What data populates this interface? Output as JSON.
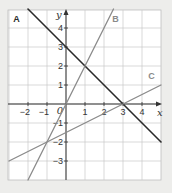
{
  "chart_data": {
    "type": "line",
    "title": "",
    "xlabel": "x",
    "ylabel": "y",
    "origin_label": "0",
    "xlim": [
      -3,
      5
    ],
    "ylim": [
      -4,
      5
    ],
    "grid": true,
    "x_ticks": [
      -2,
      -1,
      1,
      2,
      3,
      4
    ],
    "x_tick_labels": [
      "−2",
      "−1",
      "1",
      "2",
      "3",
      "4"
    ],
    "y_ticks": [
      4,
      3,
      2,
      1,
      -1,
      -2,
      -3
    ],
    "y_tick_labels": [
      "4",
      "3",
      "2",
      "1",
      "−1",
      "−2",
      "−3"
    ],
    "series": [
      {
        "name": "A",
        "equation": "y = -x + 3",
        "slope": -1,
        "intercept": 3,
        "x": [
          -2,
          5
        ],
        "y": [
          5,
          -2
        ],
        "color": "#2a2a2a"
      },
      {
        "name": "B",
        "equation": "y = 2x",
        "slope": 2,
        "intercept": 0,
        "x": [
          -2,
          2.5
        ],
        "y": [
          -4,
          5
        ],
        "color": "#8a8a8a"
      },
      {
        "name": "C",
        "equation": "y = 0.5x - 1.5",
        "slope": 0.5,
        "intercept": -1.5,
        "x": [
          -3,
          5
        ],
        "y": [
          -3,
          1
        ],
        "color": "#8a8a8a"
      }
    ],
    "annotations": [
      {
        "text": "A",
        "x": -2.6,
        "y": 4.3
      },
      {
        "text": "B",
        "x": 2.6,
        "y": 4.3
      },
      {
        "text": "C",
        "x": 4.5,
        "y": 1.3
      }
    ]
  }
}
